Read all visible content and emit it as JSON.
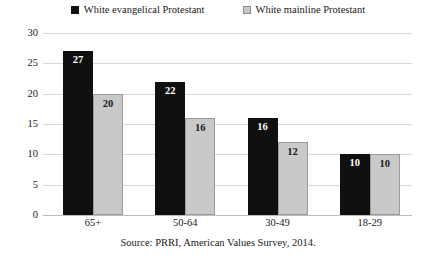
{
  "legend": {
    "position": "top-center",
    "entries": [
      {
        "label": "White evangelical Protestant",
        "marker": "filled-square-icon",
        "color": "#101010"
      },
      {
        "label": "White mainline Protestant",
        "marker": "outlined-square-icon",
        "color": "#c9c9c9"
      }
    ]
  },
  "source_note": "Source: PRRI, American Values Survey, 2014.",
  "chart_data": {
    "type": "bar",
    "title": "",
    "subtitle": "",
    "xlabel": "",
    "ylabel": "",
    "categories": [
      "65+",
      "50-64",
      "30-49",
      "18-29"
    ],
    "series": [
      {
        "name": "White evangelical Protestant",
        "color": "#101010",
        "values": [
          27,
          22,
          16,
          10
        ]
      },
      {
        "name": "White mainline Protestant",
        "color": "#c9c9c9",
        "values": [
          20,
          16,
          12,
          10
        ]
      }
    ],
    "ylim": [
      0,
      30
    ],
    "yticks": [
      0,
      5,
      10,
      15,
      20,
      25,
      30
    ],
    "ytick_labels": [
      "0",
      "5",
      "10",
      "15",
      "20",
      "25",
      "30"
    ],
    "grid": true,
    "grid_axis": "y",
    "legend_position": "top-center",
    "data_labels": true,
    "annotations": [
      "Source: PRRI, American Values Survey, 2014."
    ]
  }
}
